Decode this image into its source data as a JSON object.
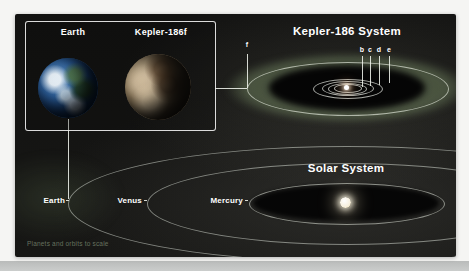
{
  "infographic": {
    "caption": "Planets and orbits to scale"
  },
  "comparison_box": {
    "earth_label": "Earth",
    "kepler_planet_label": "Kepler-186f"
  },
  "kepler_system": {
    "title": "Kepler-186 System",
    "outer_planet_label": "f",
    "inner_planet_labels": [
      "b",
      "c",
      "d",
      "e"
    ]
  },
  "solar_system": {
    "title": "Solar System",
    "planet_labels": [
      "Earth",
      "Venus",
      "Mercury"
    ]
  },
  "colors": {
    "panel_background": "#141412",
    "habitable_zone_green": "#6e8260",
    "orbit_line": "#dde3d6",
    "label_text": "#ffffff",
    "caption_text": "#66725f",
    "page_background": "#f5f5f3",
    "bottom_band": "#c6c8c7"
  }
}
